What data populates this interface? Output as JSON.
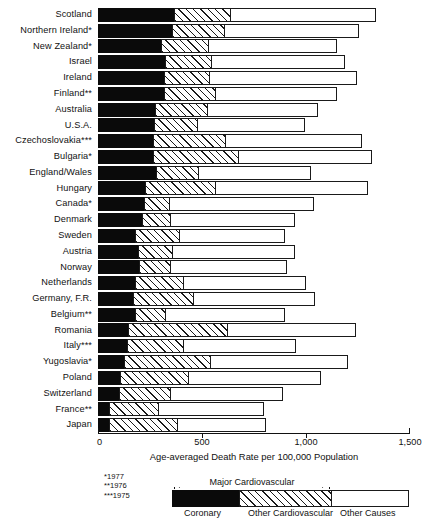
{
  "chart": {
    "type": "bar",
    "orientation": "horizontal",
    "stacked": true,
    "xlabel": "Age-averaged Death Rate per 100,000 Population",
    "ylabel": "",
    "title": "",
    "xlim": [
      0,
      1500
    ],
    "xticks": [
      0,
      500,
      1000,
      1500
    ],
    "xticklabels": [
      "0",
      "500",
      "1,000",
      "1,500"
    ],
    "grid": false,
    "legend_position": "bottom"
  },
  "chart_data": {
    "type": "bar",
    "orientation": "horizontal",
    "stacked": true,
    "title": "",
    "xlabel": "Age-averaged Death Rate per 100,000 Population",
    "ylabel": "",
    "xlim": [
      0,
      1500
    ],
    "xticks": [
      0,
      500,
      1000,
      1500
    ],
    "xticklabels": [
      "0",
      "500",
      "1,000",
      "1,500"
    ],
    "grid": false,
    "legend_position": "bottom",
    "categories": [
      "Scotland",
      "Northern Ireland*",
      "New Zealand*",
      "Israel",
      "Ireland",
      "Finland**",
      "Australia",
      "U.S.A.",
      "Czechoslovakia***",
      "Bulgaria*",
      "England/Wales",
      "Hungary",
      "Canada*",
      "Denmark",
      "Sweden",
      "Austria",
      "Norway",
      "Netherlands",
      "Germany, F.R.",
      "Belgium**",
      "Romania",
      "Italy***",
      "Yugoslavia*",
      "Poland",
      "Switzerland",
      "France**",
      "Japan"
    ],
    "series": [
      {
        "name": "Coronary",
        "color": "#0a0a0a",
        "values": [
          370,
          360,
          310,
          325,
          320,
          320,
          280,
          275,
          270,
          270,
          285,
          230,
          225,
          215,
          185,
          195,
          200,
          185,
          175,
          185,
          150,
          145,
          130,
          110,
          105,
          60,
          58
        ]
      },
      {
        "name": "Other Cardiovascular",
        "color": "#ffffff",
        "hatch": "///",
        "values": [
          275,
          255,
          230,
          230,
          225,
          250,
          255,
          210,
          350,
          415,
          205,
          340,
          125,
          140,
          215,
          170,
          155,
          235,
          290,
          145,
          480,
          275,
          420,
          330,
          250,
          240,
          330
        ]
      },
      {
        "name": "Other Causes",
        "color": "#ffffff",
        "values": [
          700,
          650,
          620,
          640,
          710,
          590,
          530,
          520,
          660,
          640,
          545,
          740,
          700,
          600,
          510,
          590,
          565,
          590,
          590,
          580,
          620,
          540,
          660,
          640,
          545,
          510,
          430
        ]
      }
    ],
    "totals": [
      1345,
      1265,
      1160,
      1195,
      1255,
      1160,
      1065,
      1005,
      1280,
      1325,
      1035,
      1310,
      1050,
      955,
      910,
      955,
      920,
      1010,
      1055,
      910,
      1250,
      960,
      1210,
      1080,
      900,
      810,
      818
    ]
  },
  "ytick_labels": [
    "Scotland",
    "Northern Ireland*",
    "New Zealand*",
    "Israel",
    "Ireland",
    "Finland**",
    "Australia",
    "U.S.A.",
    "Czechoslovakia***",
    "Bulgaria*",
    "England/Wales",
    "Hungary",
    "Canada*",
    "Denmark",
    "Sweden",
    "Austria",
    "Norway",
    "Netherlands",
    "Germany, F.R.",
    "Belgium**",
    "Romania",
    "Italy***",
    "Yugoslavia*",
    "Poland",
    "Switzerland",
    "France**",
    "Japan"
  ],
  "footnotes": [
    "*1977",
    "**1976",
    "***1975"
  ],
  "legend": {
    "bracket_label": "Major Cardiovascular",
    "items": [
      {
        "label": "Coronary",
        "style": "solid-black"
      },
      {
        "label": "Other Cardiovascular",
        "style": "hatched"
      },
      {
        "label": "Other Causes",
        "style": "white"
      }
    ]
  },
  "colors": {
    "coronary": "#0a0a0a",
    "other_cardiovascular_line": "#1a1a1a",
    "other_causes": "#ffffff",
    "axis": "#111111",
    "text": "#111111"
  }
}
